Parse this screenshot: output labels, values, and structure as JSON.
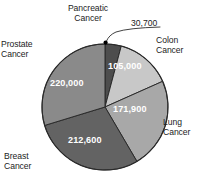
{
  "chart_data": {
    "type": "pie",
    "title": "",
    "subtitle": "",
    "xlabel": "",
    "ylabel": "",
    "legend_position": "labels-outside",
    "grid": false,
    "total": 740200,
    "start_angle_deg": 0,
    "direction": "clockwise",
    "categories": [
      "Pancreatic Cancer",
      "Colon Cancer",
      "Lung Cancer",
      "Breast Cancer",
      "Prostate Cancer"
    ],
    "values": [
      30700,
      105000,
      171900,
      212600,
      220000
    ],
    "value_labels": [
      "30,700",
      "105,000",
      "171,900",
      "212,600",
      "220,000"
    ],
    "slices": [
      {
        "label": "Pancreatic Cancer",
        "label_lines": "Pancreatic\nCancer",
        "value": 30700,
        "value_label": "30,700",
        "angle_deg": 14.9,
        "color": "#4d4d4d",
        "label_placement": "outside-top",
        "value_placement": "callout"
      },
      {
        "label": "Colon Cancer",
        "label_lines": "Colon\nCancer",
        "value": 105000,
        "value_label": "105,000",
        "angle_deg": 51.1,
        "color": "#c8c8c8",
        "label_placement": "outside-right-top",
        "value_placement": "inside"
      },
      {
        "label": "Lung Cancer",
        "label_lines": "Lung\nCancer",
        "value": 171900,
        "value_label": "171,900",
        "angle_deg": 83.6,
        "color": "#a8a8a8",
        "label_placement": "outside-right-bottom",
        "value_placement": "inside"
      },
      {
        "label": "Breast Cancer",
        "label_lines": "Breast\nCancer",
        "value": 212600,
        "value_label": "212,600",
        "angle_deg": 103.4,
        "color": "#636363",
        "label_placement": "outside-left-bottom",
        "value_placement": "inside"
      },
      {
        "label": "Prostate Cancer",
        "label_lines": "Prostate\nCancer",
        "value": 220000,
        "value_label": "220,000",
        "angle_deg": 107.0,
        "color": "#8a8a8a",
        "label_placement": "outside-left-top",
        "value_placement": "inside"
      }
    ]
  },
  "labels": {
    "pancreatic": "Pancreatic\nCancer",
    "colon": "Colon\nCancer",
    "lung": "Lung\nCancer",
    "breast": "Breast\nCancer",
    "prostate": "Prostate\nCancer"
  },
  "values": {
    "pancreatic": "30,700",
    "colon": "105,000",
    "lung": "171,900",
    "breast": "212,600",
    "prostate": "220,000"
  },
  "colors": {
    "pancreatic": "#4d4d4d",
    "colon": "#c8c8c8",
    "lung": "#a8a8a8",
    "breast": "#636363",
    "prostate": "#8a8a8a",
    "outline": "#2b2b2b",
    "text": "#1c1c1c",
    "inside_text": "#ffffff",
    "background": "#ffffff",
    "marker": "#000000"
  }
}
